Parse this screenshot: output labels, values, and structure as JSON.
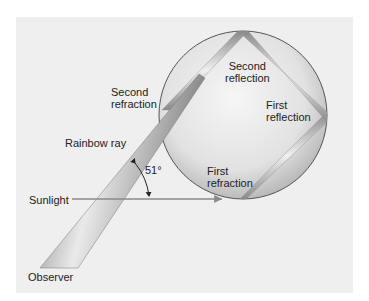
{
  "diagram": {
    "colors": {
      "background": "#ffffff",
      "panel": "#efefef",
      "drop_fill_light": "#f4f4f4",
      "drop_fill_dark": "#b9b9b9",
      "drop_outline": "#555555",
      "ray_light": "#e8e8e8",
      "ray_dark": "#707070",
      "sunlight_line": "#8a8a8a",
      "text": "#222222"
    },
    "labels": {
      "second_reflection": [
        "Second",
        "reflection"
      ],
      "second_refraction": [
        "Second",
        "refraction"
      ],
      "first_reflection": [
        "First",
        "reflection"
      ],
      "first_refraction": [
        "First",
        "refraction"
      ],
      "rainbow_ray": "Rainbow ray",
      "angle": "51°",
      "sunlight": "Sunlight",
      "observer": "Observer"
    }
  }
}
